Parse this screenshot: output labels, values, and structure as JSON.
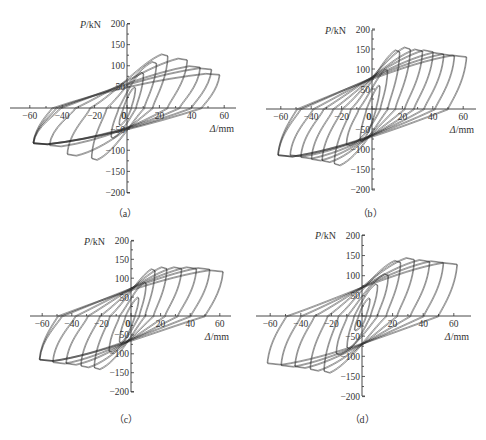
{
  "figure": {
    "background": "#ffffff",
    "line_color": "#222222"
  },
  "chart_data": [
    {
      "type": "line",
      "id": "a",
      "caption": "（a）",
      "title": "",
      "ylabel": "P/kN",
      "xlabel": "Δ/mm",
      "xlim": [
        -70,
        70
      ],
      "ylim": [
        -200,
        200
      ],
      "xticks": [
        -60,
        -40,
        -20,
        0,
        20,
        40,
        60
      ],
      "yticks": [
        -200,
        -150,
        -100,
        -50,
        50,
        100,
        150,
        200
      ],
      "grid": false,
      "series_description": "Load-displacement hysteresis loops",
      "peaks_positive": [
        [
          5,
          50
        ],
        [
          10,
          85
        ],
        [
          18,
          110
        ],
        [
          25,
          128
        ],
        [
          37,
          118
        ],
        [
          45,
          100
        ],
        [
          52,
          95
        ],
        [
          57,
          82
        ]
      ],
      "peaks_negative": [
        [
          -5,
          -40
        ],
        [
          -10,
          -70
        ],
        [
          -22,
          -122
        ],
        [
          -37,
          -112
        ],
        [
          -48,
          -90
        ],
        [
          -58,
          -85
        ]
      ],
      "residual": {
        "pos_intercept": 70,
        "neg_intercept": -65
      }
    },
    {
      "type": "line",
      "id": "b",
      "caption": "（b）",
      "title": "",
      "ylabel": "P/kN",
      "xlabel": "Δ/mm",
      "xlim": [
        -70,
        70
      ],
      "ylim": [
        -200,
        200
      ],
      "xticks": [
        -60,
        -40,
        -20,
        0,
        20,
        40,
        60
      ],
      "yticks": [
        -200,
        -150,
        -100,
        -50,
        50,
        100,
        150,
        200
      ],
      "grid": false,
      "series_description": "Load-displacement hysteresis loops",
      "peaks_positive": [
        [
          5,
          60
        ],
        [
          10,
          100
        ],
        [
          18,
          148
        ],
        [
          25,
          155
        ],
        [
          33,
          150
        ],
        [
          40,
          148
        ],
        [
          47,
          142
        ],
        [
          54,
          138
        ],
        [
          62,
          135
        ]
      ],
      "peaks_negative": [
        [
          -8,
          -80
        ],
        [
          -17,
          -90
        ],
        [
          -25,
          -140
        ],
        [
          -33,
          -132
        ],
        [
          -40,
          -128
        ],
        [
          -47,
          -123
        ],
        [
          -54,
          -118
        ],
        [
          -62,
          -118
        ]
      ],
      "residual": {
        "pos_intercept": 90,
        "neg_intercept": -85
      }
    },
    {
      "type": "line",
      "id": "c",
      "caption": "（c）",
      "title": "",
      "ylabel": "P/kN",
      "xlabel": "Δ/mm",
      "xlim": [
        -70,
        70
      ],
      "ylim": [
        -200,
        200
      ],
      "xticks": [
        -60,
        -40,
        -20,
        0,
        20,
        40,
        60
      ],
      "yticks": [
        -200,
        -150,
        -100,
        -50,
        50,
        100,
        150,
        200
      ],
      "grid": false,
      "series_description": "Load-displacement hysteresis loops",
      "peaks_positive": [
        [
          5,
          50
        ],
        [
          10,
          90
        ],
        [
          16,
          125
        ],
        [
          24,
          130
        ],
        [
          34,
          130
        ],
        [
          44,
          130
        ],
        [
          53,
          128
        ],
        [
          62,
          122
        ]
      ],
      "peaks_negative": [
        [
          -8,
          -70
        ],
        [
          -15,
          -95
        ],
        [
          -25,
          -140
        ],
        [
          -34,
          -135
        ],
        [
          -44,
          -128
        ],
        [
          -53,
          -125
        ],
        [
          -62,
          -118
        ]
      ],
      "residual": {
        "pos_intercept": 85,
        "neg_intercept": -70
      }
    },
    {
      "type": "line",
      "id": "d",
      "caption": "（d）",
      "title": "",
      "ylabel": "P/kN",
      "xlabel": "Δ/mm",
      "xlim": [
        -70,
        70
      ],
      "ylim": [
        -200,
        200
      ],
      "xticks": [
        -60,
        -40,
        -20,
        0,
        20,
        40,
        60
      ],
      "yticks": [
        -200,
        -150,
        -100,
        -50,
        50,
        100,
        150,
        200
      ],
      "grid": false,
      "series_description": "Load-displacement hysteresis loops",
      "peaks_positive": [
        [
          5,
          45
        ],
        [
          10,
          80
        ],
        [
          17,
          105
        ],
        [
          25,
          138
        ],
        [
          34,
          145
        ],
        [
          44,
          140
        ],
        [
          53,
          137
        ],
        [
          62,
          133
        ]
      ],
      "peaks_negative": [
        [
          -5,
          -35
        ],
        [
          -10,
          -80
        ],
        [
          -17,
          -95
        ],
        [
          -25,
          -140
        ],
        [
          -34,
          -135
        ],
        [
          -44,
          -128
        ],
        [
          -53,
          -125
        ],
        [
          -62,
          -120
        ]
      ],
      "residual": {
        "pos_intercept": 75,
        "neg_intercept": -80
      }
    }
  ],
  "panels_layout": [
    {
      "id": "a",
      "x0": 127,
      "y0": 108,
      "sx": 1.62,
      "sy": 0.4225,
      "xmin_px": 10,
      "xmax_px": 236,
      "ymin_px": 24,
      "ymax_px": 193,
      "cap_x": 125,
      "cap_y": 217
    },
    {
      "id": "b",
      "x0": 372,
      "y0": 109,
      "sx": 1.52,
      "sy": 0.4,
      "xmin_px": 266,
      "xmax_px": 476,
      "ymin_px": 30,
      "ymax_px": 190,
      "cap_x": 370,
      "cap_y": 217
    },
    {
      "id": "c",
      "x0": 131,
      "y0": 316,
      "sx": 1.48,
      "sy": 0.378,
      "xmin_px": 30,
      "xmax_px": 231,
      "ymin_px": 241,
      "ymax_px": 392,
      "cap_x": 126,
      "cap_y": 423
    },
    {
      "id": "d",
      "x0": 362,
      "y0": 316,
      "sx": 1.53,
      "sy": 0.403,
      "xmin_px": 256,
      "xmax_px": 471,
      "ymin_px": 235,
      "ymax_px": 396,
      "cap_x": 362,
      "cap_y": 423
    }
  ]
}
